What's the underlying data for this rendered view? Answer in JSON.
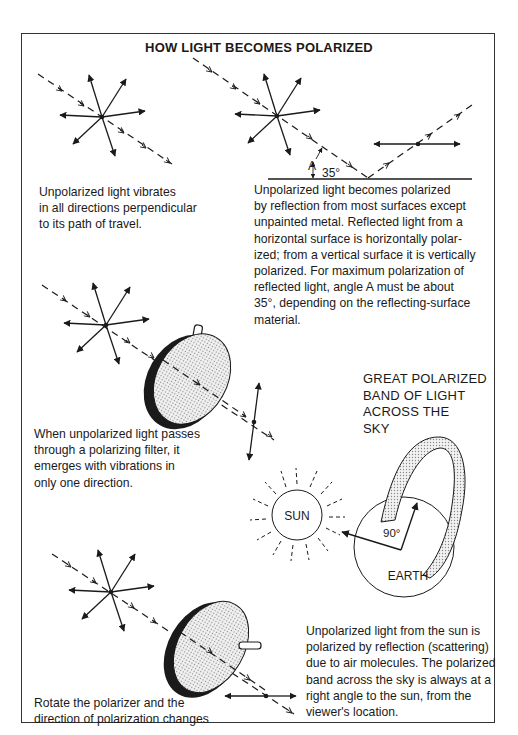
{
  "title": "HOW LIGHT BECOMES POLARIZED",
  "panels": {
    "unpolarized": {
      "caption": "Unpolarized light vibrates\nin all directions perpendicular\nto its path of travel."
    },
    "reflection": {
      "angle_label": "A",
      "angle_value": "35°",
      "caption": "Unpolarized light becomes polarized\nby reflection from most surfaces except\nunpainted metal. Reflected light from a\nhorizontal surface is horizontally polar-\nized; from a vertical surface it is vertically\npolarized. For maximum polarization of\nreflected light, angle A must be about\n35°, depending on the reflecting-surface\nmaterial."
    },
    "filter": {
      "caption": "When unpolarized light passes\nthrough a polarizing filter, it\nemerges with vibrations in\nonly one direction."
    },
    "sky": {
      "band_label": "GREAT POLARIZED\nBAND OF LIGHT\nACROSS THE\nSKY",
      "sun_label": "SUN",
      "earth_label": "EARTH",
      "angle_label": "90°",
      "caption": "Unpolarized light from the sun is\npolarized by reflection (scattering)\ndue to air molecules. The polarized\nband across the sky is always at a\nright angle to the sun, from the\nviewer's location."
    },
    "rotate": {
      "caption": "Rotate the polarizer and the\ndirection of polarization changes"
    }
  },
  "colors": {
    "ink": "#1a1a1a",
    "frame": "#333333",
    "stipple": "#d8d8d8",
    "background": "#ffffff"
  }
}
